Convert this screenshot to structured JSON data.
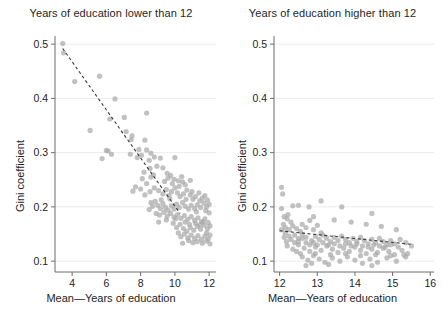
{
  "figure": {
    "background": "#ffffff",
    "point_color": "#a9a9a9",
    "trend_color": "#3a3a3a",
    "axis_color": "#6d6d6d",
    "grid_color": "#ececec"
  },
  "axis_labels": {
    "y": "Gini coefficient",
    "x_left": "Mean—Years of education",
    "x_right": "Mean—Years of education"
  },
  "chart_data": [
    {
      "type": "scatter",
      "title": "Years of education lower than 12",
      "xlabel": "Mean—Years of education",
      "ylabel": "Gini coefficient",
      "xlim": [
        3.0,
        12.4
      ],
      "ylim": [
        0.08,
        0.515
      ],
      "xticks": [
        4,
        6,
        8,
        10,
        12
      ],
      "xticklabels": [
        "4",
        "6",
        "8",
        "10",
        "12"
      ],
      "yticks": [
        0.1,
        0.2,
        0.3,
        0.4,
        0.5
      ],
      "yticklabels": [
        "0.1",
        "0.2",
        "0.3",
        "0.4",
        "0.5"
      ],
      "grid": "horizontal",
      "legend": "none",
      "trendline": {
        "style": "dashed",
        "x": [
          3.45,
          10.3
        ],
        "y": [
          0.492,
          0.188
        ]
      },
      "points": [
        [
          3.45,
          0.501
        ],
        [
          3.5,
          0.484
        ],
        [
          4.15,
          0.431
        ],
        [
          5.6,
          0.441
        ],
        [
          5.05,
          0.341
        ],
        [
          6.5,
          0.399
        ],
        [
          6.2,
          0.362
        ],
        [
          7.05,
          0.365
        ],
        [
          8.35,
          0.373
        ],
        [
          6.0,
          0.304
        ],
        [
          6.1,
          0.303
        ],
        [
          6.3,
          0.297
        ],
        [
          5.75,
          0.289
        ],
        [
          7.15,
          0.339
        ],
        [
          7.45,
          0.324
        ],
        [
          7.5,
          0.331
        ],
        [
          8.25,
          0.323
        ],
        [
          8.35,
          0.305
        ],
        [
          8.6,
          0.299
        ],
        [
          8.05,
          0.295
        ],
        [
          7.8,
          0.291
        ],
        [
          7.4,
          0.297
        ],
        [
          7.9,
          0.306
        ],
        [
          8.5,
          0.286
        ],
        [
          8.8,
          0.292
        ],
        [
          9.15,
          0.29
        ],
        [
          10.0,
          0.291
        ],
        [
          8.55,
          0.271
        ],
        [
          8.95,
          0.275
        ],
        [
          9.3,
          0.272
        ],
        [
          9.55,
          0.262
        ],
        [
          9.75,
          0.258
        ],
        [
          9.95,
          0.251
        ],
        [
          10.2,
          0.248
        ],
        [
          10.45,
          0.246
        ],
        [
          10.6,
          0.241
        ],
        [
          8.1,
          0.252
        ],
        [
          7.7,
          0.237
        ],
        [
          7.55,
          0.229
        ],
        [
          8.0,
          0.233
        ],
        [
          8.25,
          0.222
        ],
        [
          8.55,
          0.228
        ],
        [
          8.8,
          0.235
        ],
        [
          9.05,
          0.23
        ],
        [
          9.3,
          0.224
        ],
        [
          9.5,
          0.232
        ],
        [
          9.65,
          0.221
        ],
        [
          9.8,
          0.228
        ],
        [
          10.0,
          0.235
        ],
        [
          10.15,
          0.226
        ],
        [
          10.3,
          0.219
        ],
        [
          10.5,
          0.224
        ],
        [
          10.7,
          0.231
        ],
        [
          10.9,
          0.222
        ],
        [
          11.05,
          0.214
        ],
        [
          11.2,
          0.219
        ],
        [
          11.4,
          0.226
        ],
        [
          11.6,
          0.216
        ],
        [
          11.75,
          0.221
        ],
        [
          11.9,
          0.213
        ],
        [
          12.0,
          0.205
        ],
        [
          11.85,
          0.2
        ],
        [
          11.7,
          0.207
        ],
        [
          11.5,
          0.199
        ],
        [
          11.3,
          0.204
        ],
        [
          11.15,
          0.197
        ],
        [
          10.95,
          0.203
        ],
        [
          10.8,
          0.196
        ],
        [
          10.6,
          0.201
        ],
        [
          10.45,
          0.208
        ],
        [
          10.25,
          0.199
        ],
        [
          10.1,
          0.205
        ],
        [
          9.95,
          0.196
        ],
        [
          9.8,
          0.202
        ],
        [
          9.6,
          0.194
        ],
        [
          9.45,
          0.199
        ],
        [
          9.3,
          0.206
        ],
        [
          9.15,
          0.197
        ],
        [
          9.0,
          0.203
        ],
        [
          8.85,
          0.21
        ],
        [
          8.7,
          0.201
        ],
        [
          8.5,
          0.195
        ],
        [
          8.9,
          0.188
        ],
        [
          9.1,
          0.185
        ],
        [
          9.35,
          0.19
        ],
        [
          9.55,
          0.183
        ],
        [
          9.75,
          0.188
        ],
        [
          9.95,
          0.181
        ],
        [
          10.15,
          0.186
        ],
        [
          10.35,
          0.179
        ],
        [
          10.55,
          0.184
        ],
        [
          10.75,
          0.177
        ],
        [
          10.95,
          0.182
        ],
        [
          11.15,
          0.175
        ],
        [
          11.35,
          0.18
        ],
        [
          11.55,
          0.173
        ],
        [
          11.75,
          0.178
        ],
        [
          11.95,
          0.171
        ],
        [
          12.05,
          0.165
        ],
        [
          11.9,
          0.16
        ],
        [
          11.7,
          0.166
        ],
        [
          11.5,
          0.159
        ],
        [
          11.3,
          0.164
        ],
        [
          11.1,
          0.157
        ],
        [
          10.9,
          0.162
        ],
        [
          10.7,
          0.155
        ],
        [
          10.5,
          0.16
        ],
        [
          10.3,
          0.168
        ],
        [
          10.1,
          0.162
        ],
        [
          9.9,
          0.17
        ],
        [
          10.6,
          0.172
        ],
        [
          10.85,
          0.168
        ],
        [
          11.2,
          0.17
        ],
        [
          11.45,
          0.167
        ],
        [
          11.65,
          0.172
        ],
        [
          11.85,
          0.152
        ],
        [
          12.05,
          0.148
        ],
        [
          11.95,
          0.141
        ],
        [
          11.75,
          0.146
        ],
        [
          11.55,
          0.14
        ],
        [
          11.35,
          0.147
        ],
        [
          11.15,
          0.142
        ],
        [
          10.95,
          0.148
        ],
        [
          10.75,
          0.143
        ],
        [
          10.55,
          0.15
        ],
        [
          10.35,
          0.145
        ],
        [
          10.2,
          0.152
        ],
        [
          11.05,
          0.134
        ],
        [
          11.3,
          0.136
        ],
        [
          11.6,
          0.133
        ],
        [
          11.85,
          0.137
        ],
        [
          12.05,
          0.132
        ],
        [
          10.45,
          0.133
        ],
        [
          10.8,
          0.138
        ],
        [
          9.7,
          0.215
        ],
        [
          9.2,
          0.213
        ],
        [
          8.35,
          0.243
        ],
        [
          8.6,
          0.255
        ],
        [
          9.4,
          0.247
        ],
        [
          9.85,
          0.243
        ],
        [
          10.25,
          0.238
        ],
        [
          10.65,
          0.214
        ],
        [
          11.0,
          0.228
        ],
        [
          11.45,
          0.211
        ],
        [
          11.8,
          0.193
        ],
        [
          12.0,
          0.189
        ],
        [
          8.2,
          0.264
        ],
        [
          8.75,
          0.259
        ],
        [
          9.6,
          0.253
        ],
        [
          10.4,
          0.256
        ],
        [
          10.9,
          0.249
        ],
        [
          11.25,
          0.191
        ],
        [
          10.05,
          0.178
        ],
        [
          9.5,
          0.176
        ],
        [
          9.05,
          0.172
        ],
        [
          8.6,
          0.208
        ]
      ]
    },
    {
      "type": "scatter",
      "title": "Years of education higher than 12",
      "xlabel": "Mean—Years of education",
      "ylabel": "Gini coefficient",
      "xlim": [
        11.85,
        16.1
      ],
      "ylim": [
        0.08,
        0.515
      ],
      "xticks": [
        12,
        13,
        14,
        15,
        16
      ],
      "xticklabels": [
        "12",
        "13",
        "14",
        "15",
        "16"
      ],
      "yticks": [
        0.1,
        0.2,
        0.3,
        0.4,
        0.5
      ],
      "yticklabels": [
        "0.1",
        "0.2",
        "0.3",
        "0.4",
        "0.5"
      ],
      "grid": "horizontal",
      "legend": "none",
      "trendline": {
        "style": "dashed",
        "x": [
          12.0,
          15.5
        ],
        "y": [
          0.156,
          0.131
        ]
      },
      "points": [
        [
          12.05,
          0.236
        ],
        [
          12.08,
          0.224
        ],
        [
          12.05,
          0.197
        ],
        [
          12.35,
          0.202
        ],
        [
          12.5,
          0.203
        ],
        [
          12.78,
          0.2
        ],
        [
          13.1,
          0.211
        ],
        [
          13.65,
          0.2
        ],
        [
          14.45,
          0.188
        ],
        [
          12.2,
          0.178
        ],
        [
          12.3,
          0.172
        ],
        [
          12.1,
          0.168
        ],
        [
          12.15,
          0.162
        ],
        [
          12.25,
          0.158
        ],
        [
          12.35,
          0.165
        ],
        [
          12.45,
          0.16
        ],
        [
          12.55,
          0.155
        ],
        [
          12.6,
          0.168
        ],
        [
          12.7,
          0.162
        ],
        [
          12.8,
          0.175
        ],
        [
          12.9,
          0.158
        ],
        [
          13.0,
          0.166
        ],
        [
          13.1,
          0.152
        ],
        [
          12.4,
          0.148
        ],
        [
          12.5,
          0.142
        ],
        [
          12.6,
          0.15
        ],
        [
          12.7,
          0.144
        ],
        [
          12.85,
          0.138
        ],
        [
          12.95,
          0.146
        ],
        [
          13.05,
          0.14
        ],
        [
          13.15,
          0.148
        ],
        [
          13.25,
          0.142
        ],
        [
          13.35,
          0.136
        ],
        [
          13.45,
          0.144
        ],
        [
          13.55,
          0.138
        ],
        [
          13.65,
          0.146
        ],
        [
          13.75,
          0.14
        ],
        [
          13.85,
          0.134
        ],
        [
          13.95,
          0.142
        ],
        [
          14.05,
          0.136
        ],
        [
          14.15,
          0.144
        ],
        [
          14.25,
          0.138
        ],
        [
          14.35,
          0.132
        ],
        [
          14.45,
          0.14
        ],
        [
          14.55,
          0.134
        ],
        [
          14.65,
          0.142
        ],
        [
          14.75,
          0.136
        ],
        [
          14.85,
          0.13
        ],
        [
          14.95,
          0.138
        ],
        [
          15.05,
          0.132
        ],
        [
          15.2,
          0.14
        ],
        [
          15.35,
          0.134
        ],
        [
          15.5,
          0.128
        ],
        [
          12.2,
          0.128
        ],
        [
          12.35,
          0.122
        ],
        [
          12.5,
          0.13
        ],
        [
          12.65,
          0.124
        ],
        [
          12.8,
          0.118
        ],
        [
          12.95,
          0.126
        ],
        [
          13.1,
          0.12
        ],
        [
          13.25,
          0.128
        ],
        [
          13.4,
          0.122
        ],
        [
          13.55,
          0.116
        ],
        [
          13.7,
          0.124
        ],
        [
          13.85,
          0.118
        ],
        [
          14.0,
          0.126
        ],
        [
          14.15,
          0.12
        ],
        [
          14.3,
          0.114
        ],
        [
          14.45,
          0.122
        ],
        [
          14.6,
          0.116
        ],
        [
          14.75,
          0.124
        ],
        [
          14.9,
          0.118
        ],
        [
          15.05,
          0.112
        ],
        [
          15.25,
          0.12
        ],
        [
          15.4,
          0.114
        ],
        [
          12.6,
          0.108
        ],
        [
          12.75,
          0.102
        ],
        [
          12.9,
          0.11
        ],
        [
          13.05,
          0.104
        ],
        [
          13.2,
          0.098
        ],
        [
          13.4,
          0.106
        ],
        [
          13.6,
          0.1
        ],
        [
          13.8,
          0.108
        ],
        [
          14.0,
          0.102
        ],
        [
          14.2,
          0.096
        ],
        [
          14.4,
          0.104
        ],
        [
          14.6,
          0.098
        ],
        [
          14.85,
          0.106
        ],
        [
          15.1,
          0.1
        ],
        [
          15.35,
          0.108
        ],
        [
          12.7,
          0.092
        ],
        [
          12.85,
          0.096
        ],
        [
          13.3,
          0.094
        ],
        [
          14.45,
          0.092
        ],
        [
          12.15,
          0.152
        ],
        [
          12.25,
          0.146
        ],
        [
          12.3,
          0.14
        ],
        [
          12.4,
          0.134
        ],
        [
          12.5,
          0.136
        ],
        [
          12.6,
          0.142
        ],
        [
          12.7,
          0.134
        ],
        [
          12.8,
          0.13
        ],
        [
          12.9,
          0.134
        ],
        [
          13.0,
          0.13
        ],
        [
          13.15,
          0.134
        ],
        [
          13.3,
          0.13
        ],
        [
          13.45,
          0.132
        ],
        [
          13.6,
          0.128
        ],
        [
          13.75,
          0.132
        ],
        [
          13.9,
          0.128
        ],
        [
          14.05,
          0.132
        ],
        [
          14.2,
          0.128
        ],
        [
          14.35,
          0.126
        ],
        [
          14.5,
          0.13
        ],
        [
          14.65,
          0.128
        ],
        [
          14.8,
          0.126
        ],
        [
          14.95,
          0.13
        ],
        [
          15.15,
          0.126
        ],
        [
          12.45,
          0.118
        ],
        [
          12.55,
          0.114
        ],
        [
          12.95,
          0.114
        ],
        [
          13.35,
          0.112
        ],
        [
          13.75,
          0.114
        ],
        [
          14.15,
          0.11
        ],
        [
          14.55,
          0.112
        ],
        [
          14.95,
          0.11
        ],
        [
          15.3,
          0.112
        ],
        [
          12.22,
          0.186
        ],
        [
          12.12,
          0.182
        ],
        [
          12.9,
          0.182
        ],
        [
          13.45,
          0.176
        ],
        [
          13.9,
          0.172
        ],
        [
          14.3,
          0.168
        ],
        [
          14.7,
          0.164
        ],
        [
          15.1,
          0.158
        ],
        [
          12.05,
          0.158
        ],
        [
          12.12,
          0.144
        ],
        [
          12.18,
          0.136
        ]
      ]
    }
  ]
}
